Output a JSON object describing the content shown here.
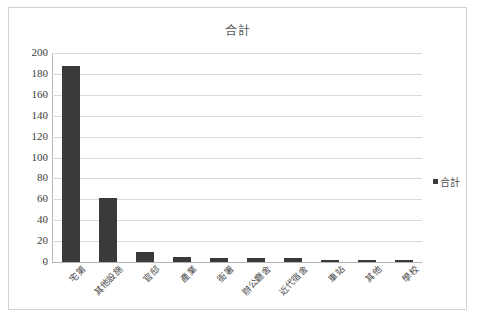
{
  "chart_data": {
    "type": "bar",
    "title": "合計",
    "xlabel": "",
    "ylabel": "",
    "ylim": [
      0,
      200
    ],
    "ytick_step": 20,
    "yticks": [
      "200",
      "180",
      "160",
      "140",
      "120",
      "100",
      "80",
      "60",
      "40",
      "20",
      "0"
    ],
    "grid": true,
    "legend_position": "right",
    "legend": [
      "合計"
    ],
    "series_color": "#3a3a3a",
    "categories": [
      "宅第",
      "其他設施",
      "官邸",
      "產業",
      "衙署",
      "辦公廳舍",
      "近代宿舍",
      "車站",
      "其他",
      "學校"
    ],
    "values": [
      188,
      61,
      10,
      5,
      4,
      4,
      4,
      2,
      2,
      2
    ],
    "series": [
      {
        "name": "合計",
        "values": [
          188,
          61,
          10,
          5,
          4,
          4,
          4,
          2,
          2,
          2
        ]
      }
    ]
  },
  "legend": {
    "marker": "square-marker",
    "label": "合計"
  },
  "frame": {
    "border_color": "#d2d2d2",
    "background": "#ffffff"
  }
}
